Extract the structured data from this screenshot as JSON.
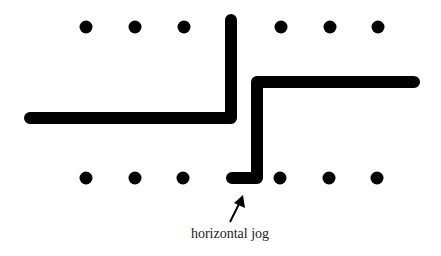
{
  "diagram": {
    "label": "horizontal jog",
    "colors": {
      "wire": "#000000",
      "dot": "#000000",
      "text": "#222222",
      "background": "#ffffff"
    },
    "top_row_dots": [
      {
        "x": 86,
        "y": 27
      },
      {
        "x": 135,
        "y": 27
      },
      {
        "x": 184,
        "y": 27
      },
      {
        "x": 281,
        "y": 27
      },
      {
        "x": 330,
        "y": 27
      },
      {
        "x": 378,
        "y": 27
      }
    ],
    "bottom_row_dots": [
      {
        "x": 86,
        "y": 178
      },
      {
        "x": 135,
        "y": 178
      },
      {
        "x": 183,
        "y": 178
      },
      {
        "x": 280,
        "y": 178
      },
      {
        "x": 329,
        "y": 178
      },
      {
        "x": 377,
        "y": 178
      }
    ],
    "wires": [
      {
        "name": "left-wire",
        "points": "30,118 231,118 231,20"
      },
      {
        "name": "right-wire",
        "points": "414,82 257,82 257,178 232,178"
      }
    ],
    "arrow": {
      "from": [
        230,
        222
      ],
      "to": [
        243,
        195
      ]
    }
  }
}
